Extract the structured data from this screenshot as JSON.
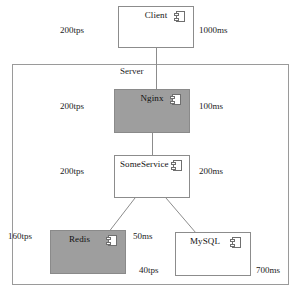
{
  "diagram": {
    "boundary": {
      "label": "Server",
      "name": "server-boundary"
    },
    "colors": {
      "shaded_fill": "#9e9e9e",
      "plain_fill": "#ffffff",
      "stroke": "#8c8c8c",
      "boundary_stroke": "#9a9a9a",
      "text": "#111111"
    },
    "icon_name": "component-icon",
    "nodes": [
      {
        "id": "client",
        "label": "Client",
        "style": "plain",
        "x": 118,
        "y": 6,
        "w": 76,
        "h": 42,
        "icon": true
      },
      {
        "id": "nginx",
        "label": "Nginx",
        "style": "shaded",
        "x": 114,
        "y": 89,
        "w": 76,
        "h": 44,
        "icon": true
      },
      {
        "id": "someservice",
        "label": "SomeService",
        "style": "plain",
        "x": 114,
        "y": 155,
        "w": 76,
        "h": 43,
        "icon": true
      },
      {
        "id": "redis",
        "label": "Redis",
        "style": "shaded",
        "x": 50,
        "y": 230,
        "w": 76,
        "h": 44,
        "icon": true
      },
      {
        "id": "mysql",
        "label": "MySQL",
        "style": "plain",
        "x": 175,
        "y": 232,
        "w": 76,
        "h": 44,
        "icon": true
      }
    ],
    "edges": [
      {
        "id": "client-nginx",
        "from": "client",
        "to": "nginx"
      },
      {
        "id": "nginx-someservice",
        "from": "nginx",
        "to": "someservice"
      },
      {
        "id": "someservice-redis",
        "from": "someservice",
        "to": "redis"
      },
      {
        "id": "someservice-mysql",
        "from": "someservice",
        "to": "mysql"
      }
    ],
    "labels": [
      {
        "id": "client-tps",
        "text": "200tps",
        "side": "left",
        "x": 60,
        "y": 25
      },
      {
        "id": "client-latency",
        "text": "1000ms",
        "side": "right",
        "x": 199,
        "y": 25
      },
      {
        "id": "nginx-tps",
        "text": "200tps",
        "side": "left",
        "x": 60,
        "y": 101
      },
      {
        "id": "nginx-latency",
        "text": "100ms",
        "side": "right",
        "x": 199,
        "y": 101
      },
      {
        "id": "service-tps",
        "text": "200tps",
        "side": "left",
        "x": 60,
        "y": 166
      },
      {
        "id": "service-latency",
        "text": "200ms",
        "side": "right",
        "x": 199,
        "y": 166
      },
      {
        "id": "redis-tps",
        "text": "160tps",
        "side": "left",
        "x": 8,
        "y": 231
      },
      {
        "id": "redis-latency",
        "text": "50ms",
        "side": "right",
        "x": 133,
        "y": 231
      },
      {
        "id": "mysql-tps",
        "text": "40tps",
        "side": "left",
        "x": 139,
        "y": 265
      },
      {
        "id": "mysql-latency",
        "text": "700ms",
        "side": "right",
        "x": 256,
        "y": 265
      }
    ]
  }
}
